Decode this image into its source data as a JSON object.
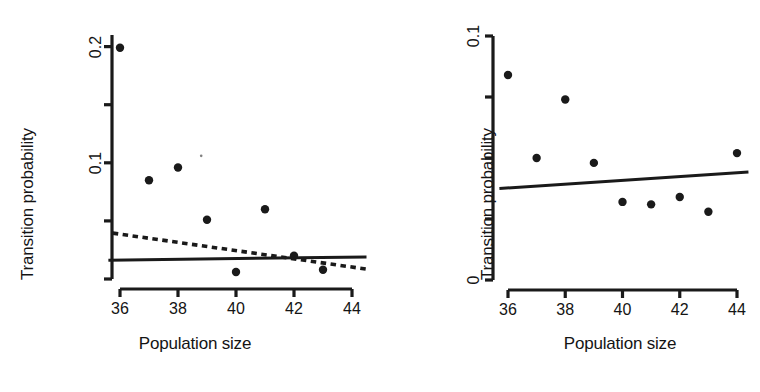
{
  "figure": {
    "background": "#ffffff",
    "ink_color": "#1a1a1a",
    "panel_count": 2
  },
  "chart_data": [
    {
      "panel": "left",
      "type": "scatter",
      "title": "",
      "xlabel": "Population size",
      "ylabel": "Transition probability",
      "xlim": [
        35.6,
        44.5
      ],
      "ylim": [
        0,
        0.21
      ],
      "xticks": [
        36,
        38,
        40,
        42,
        44
      ],
      "xtick_labels": [
        "36",
        "38",
        "40",
        "42",
        "44"
      ],
      "yticks": [
        0,
        0.05,
        0.1,
        0.15,
        0.2
      ],
      "ytick_labels": [
        "",
        "",
        "0.1",
        "",
        "0.2"
      ],
      "grid": false,
      "legend": "none",
      "x": [
        36,
        37,
        38,
        39,
        40,
        41,
        42,
        43
      ],
      "y": [
        0.199,
        0.085,
        0.096,
        0.051,
        0.006,
        0.06,
        0.02,
        0.008
      ],
      "points": [
        {
          "x": 36,
          "y": 0.199
        },
        {
          "x": 37,
          "y": 0.085
        },
        {
          "x": 38,
          "y": 0.096
        },
        {
          "x": 39,
          "y": 0.051
        },
        {
          "x": 40,
          "y": 0.006
        },
        {
          "x": 41,
          "y": 0.06
        },
        {
          "x": 42,
          "y": 0.02
        },
        {
          "x": 43,
          "y": 0.008
        }
      ],
      "speck": {
        "x": 38.8,
        "y": 0.106
      },
      "series": [
        {
          "name": "dashed-fit",
          "style": "dashed",
          "type": "line",
          "x": [
            35.75,
            44.5
          ],
          "y": [
            0.0395,
            0.0085
          ]
        },
        {
          "name": "solid-fit",
          "style": "solid",
          "type": "line",
          "x": [
            35.6,
            44.5
          ],
          "y": [
            0.0162,
            0.019
          ]
        }
      ]
    },
    {
      "panel": "right",
      "type": "scatter",
      "title": "",
      "xlabel": "Population size",
      "ylabel": "Transition probability",
      "xlim": [
        35.7,
        44.4
      ],
      "ylim": [
        0,
        0.1
      ],
      "xticks": [
        36,
        38,
        40,
        42,
        44
      ],
      "xtick_labels": [
        "36",
        "38",
        "40",
        "42",
        "44"
      ],
      "yticks": [
        0,
        0.025,
        0.05,
        0.075,
        0.1
      ],
      "ytick_labels": [
        "0",
        "",
        "",
        "",
        "0.1"
      ],
      "grid": false,
      "legend": "none",
      "x": [
        36,
        37,
        38,
        39,
        40,
        41,
        42,
        43,
        44
      ],
      "y": [
        0.084,
        0.05,
        0.074,
        0.048,
        0.032,
        0.031,
        0.034,
        0.028,
        0.052
      ],
      "points": [
        {
          "x": 36,
          "y": 0.084
        },
        {
          "x": 37,
          "y": 0.05
        },
        {
          "x": 38,
          "y": 0.074
        },
        {
          "x": 39,
          "y": 0.048
        },
        {
          "x": 40,
          "y": 0.032
        },
        {
          "x": 41,
          "y": 0.031
        },
        {
          "x": 42,
          "y": 0.034
        },
        {
          "x": 43,
          "y": 0.028
        },
        {
          "x": 44,
          "y": 0.052
        }
      ],
      "series": [
        {
          "name": "solid-fit",
          "style": "solid",
          "type": "line",
          "x": [
            35.7,
            44.4
          ],
          "y": [
            0.0375,
            0.0443
          ]
        }
      ]
    }
  ],
  "panels": {
    "left": {
      "ylabel": "Transition probability",
      "xlabel": "Population size",
      "ytick_labels": [
        {
          "value": 0.2,
          "text": "0.2"
        },
        {
          "value": 0.15,
          "text": ""
        },
        {
          "value": 0.1,
          "text": "0.1"
        },
        {
          "value": 0.05,
          "text": ""
        },
        {
          "value": 0.0,
          "text": ""
        }
      ],
      "xtick_labels": [
        {
          "value": 36,
          "text": "36"
        },
        {
          "value": 38,
          "text": "38"
        },
        {
          "value": 40,
          "text": "40"
        },
        {
          "value": 42,
          "text": "42"
        },
        {
          "value": 44,
          "text": "44"
        }
      ]
    },
    "right": {
      "ylabel": "Transition probability",
      "xlabel": "Population size",
      "ytick_labels": [
        {
          "value": 0.1,
          "text": "0.1"
        },
        {
          "value": 0.075,
          "text": ""
        },
        {
          "value": 0.05,
          "text": ""
        },
        {
          "value": 0.025,
          "text": ""
        },
        {
          "value": 0.0,
          "text": "0"
        }
      ],
      "xtick_labels": [
        {
          "value": 36,
          "text": "36"
        },
        {
          "value": 38,
          "text": "38"
        },
        {
          "value": 40,
          "text": "40"
        },
        {
          "value": 42,
          "text": "42"
        },
        {
          "value": 44,
          "text": "44"
        }
      ]
    }
  }
}
